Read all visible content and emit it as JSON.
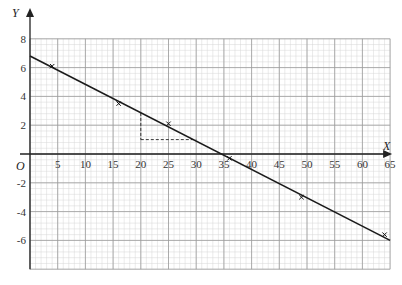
{
  "chart_data": {
    "type": "scatter",
    "title": "",
    "xlabel": "X",
    "ylabel": "Y",
    "origin_label": "O",
    "xlim": [
      0,
      65
    ],
    "ylim": [
      -8,
      8
    ],
    "grid": true,
    "x_ticks": [
      5,
      10,
      15,
      20,
      25,
      30,
      35,
      40,
      45,
      50,
      55,
      60,
      65
    ],
    "y_ticks": [
      8,
      6,
      4,
      2,
      -2,
      -4,
      -6
    ],
    "points": [
      {
        "x": 4,
        "y": 6.1
      },
      {
        "x": 16,
        "y": 3.5
      },
      {
        "x": 25,
        "y": 2.1
      },
      {
        "x": 36,
        "y": -0.3
      },
      {
        "x": 49,
        "y": -3.0
      },
      {
        "x": 64,
        "y": -5.6
      }
    ],
    "fit_line": {
      "x1": 0,
      "y1": 6.8,
      "x2": 65,
      "y2": -6.0
    },
    "annotation_dashed": {
      "vertical": {
        "x": 20,
        "y_from": 2.85,
        "y_to": 1
      },
      "horizontal": {
        "y": 1,
        "x_from": 20,
        "x_to": 30
      }
    },
    "legend": null
  }
}
